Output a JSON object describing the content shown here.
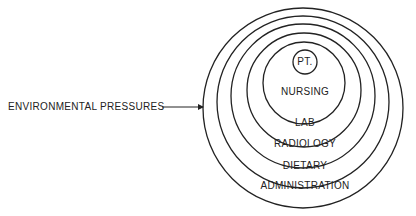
{
  "diagram": {
    "external_label": "ENVIRONMENTAL PRESSURES",
    "rings": [
      {
        "label": "ADMINISTRATION",
        "cx": 303,
        "cy": 108,
        "r": 100,
        "label_y": 180
      },
      {
        "label": "DIETARY",
        "cx": 303,
        "cy": 102,
        "r": 86,
        "label_y": 160
      },
      {
        "label": "RADIOLOGY",
        "cx": 303,
        "cy": 96,
        "r": 72,
        "label_y": 138
      },
      {
        "label": "LAB",
        "cx": 304,
        "cy": 90,
        "r": 57,
        "label_y": 117
      },
      {
        "label": "NURSING",
        "cx": 304,
        "cy": 83,
        "r": 41,
        "label_y": 86
      },
      {
        "label": "PT.",
        "cx": 305,
        "cy": 62,
        "r": 12,
        "label_y": 56
      }
    ],
    "stroke_color": "#222222"
  }
}
